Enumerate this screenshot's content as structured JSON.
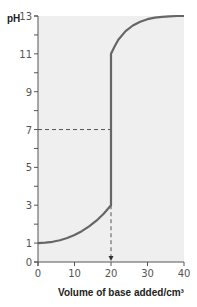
{
  "chart_data": {
    "type": "line",
    "title": "",
    "xlabel": "Volume of base added/cm³",
    "ylabel": "pH",
    "xlim": [
      0,
      40
    ],
    "ylim": [
      0,
      13
    ],
    "x_ticks": [
      0,
      10,
      20,
      30,
      40
    ],
    "y_ticks": [
      0,
      1,
      3,
      5,
      7,
      9,
      11,
      13
    ],
    "y_minor_ticks": [
      2,
      4,
      6,
      8,
      10,
      12
    ],
    "grid": false,
    "legend": "none",
    "background_color": "#efefef",
    "line_color": "#666666",
    "series": [
      {
        "name": "titration curve",
        "x": [
          0,
          2,
          4,
          6,
          8,
          10,
          12,
          14,
          16,
          18,
          20,
          20,
          21,
          22,
          24,
          26,
          28,
          30,
          32,
          34,
          36,
          38,
          40
        ],
        "y": [
          1.0,
          1.02,
          1.07,
          1.15,
          1.27,
          1.43,
          1.63,
          1.88,
          2.18,
          2.55,
          3.0,
          11.0,
          11.4,
          11.75,
          12.2,
          12.5,
          12.7,
          12.83,
          12.91,
          12.96,
          12.98,
          13.0,
          13.0
        ]
      }
    ],
    "annotations": [
      {
        "type": "dashed-horizontal",
        "y": 7,
        "x_from": 0,
        "x_to": 20
      },
      {
        "type": "dashed-vertical-arrow",
        "x": 20,
        "y_from": 3,
        "y_to": 0
      }
    ]
  }
}
